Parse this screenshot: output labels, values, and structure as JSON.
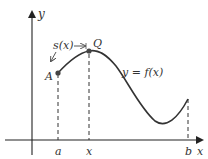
{
  "diagram": {
    "type": "arc-length function graph",
    "axes": {
      "x_label": "x",
      "y_label": "y"
    },
    "curve_label": "y = f(x)",
    "arc_label": "s(x)",
    "points": [
      {
        "name": "A",
        "label": "A"
      },
      {
        "name": "Q",
        "label": "Q"
      }
    ],
    "ticks": [
      {
        "name": "a",
        "label": "a"
      },
      {
        "name": "x",
        "label": "x"
      },
      {
        "name": "b",
        "label": "b"
      }
    ],
    "colors": {
      "curve": "#333333",
      "axes": "#222222",
      "points": "#444444"
    }
  }
}
